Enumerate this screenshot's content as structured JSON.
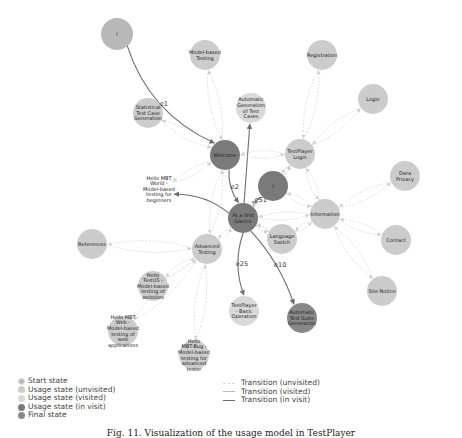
{
  "colors": {
    "start": "#b8b8b8",
    "unvisited": "#cccccc",
    "visited": "#d9d9d9",
    "in_visit": "#7a7a7a",
    "final": "#888888",
    "edge_unvisited": "#d8d8d8",
    "edge_visited": "#bcbcbc",
    "edge_in_visit": "#6e6e6e"
  },
  "nodes": [
    {
      "id": "start",
      "label": [
        "I"
      ],
      "state": "start"
    },
    {
      "id": "model-based-testing",
      "label": [
        "Model-based",
        "Testing"
      ],
      "state": "unvisited"
    },
    {
      "id": "registration",
      "label": [
        "Registration"
      ],
      "state": "unvisited"
    },
    {
      "id": "login",
      "label": [
        "Login"
      ],
      "state": "unvisited"
    },
    {
      "id": "statistical",
      "label": [
        "Statistical",
        "Test Case",
        "Generation"
      ],
      "state": "unvisited"
    },
    {
      "id": "auto-gen",
      "label": [
        "Automatic",
        "Generation",
        "of Test",
        "Cases"
      ],
      "state": "visited"
    },
    {
      "id": "welcome",
      "label": [
        "Welcome"
      ],
      "state": "in_visit"
    },
    {
      "id": "testplayer-login",
      "label": [
        "TestPlayer",
        "Login"
      ],
      "state": "unvisited"
    },
    {
      "id": "data-privacy",
      "label": [
        "Data",
        "Privacy"
      ],
      "state": "unvisited"
    },
    {
      "id": "hello-mbt-world",
      "label": [
        "Hello MBT",
        "World -",
        "Model-based",
        "testing for",
        "beginners"
      ],
      "state": "visited"
    },
    {
      "id": "inner-i",
      "label": [
        "I"
      ],
      "state": "in_visit"
    },
    {
      "id": "first-glance",
      "label": [
        "At a first",
        "Glance"
      ],
      "state": "in_visit"
    },
    {
      "id": "information",
      "label": [
        "Information"
      ],
      "state": "unvisited"
    },
    {
      "id": "language-switch",
      "label": [
        "Language",
        "Switch"
      ],
      "state": "unvisited"
    },
    {
      "id": "references",
      "label": [
        "References"
      ],
      "state": "unvisited"
    },
    {
      "id": "advanced-testing",
      "label": [
        "Advanced",
        "Testing"
      ],
      "state": "unvisited"
    },
    {
      "id": "contact",
      "label": [
        "Contact"
      ],
      "state": "unvisited"
    },
    {
      "id": "hello-testus",
      "label": [
        "Hello",
        "TestUS -",
        "Model-based",
        "testing of",
        "websites"
      ],
      "state": "unvisited"
    },
    {
      "id": "testplayer-basic",
      "label": [
        "TestPlayer",
        "- Basic",
        "Operation"
      ],
      "state": "visited"
    },
    {
      "id": "auto-suite",
      "label": [
        "Automatic",
        "Test Suite",
        "Generation"
      ],
      "state": "final"
    },
    {
      "id": "site-notice",
      "label": [
        "Site Notice"
      ],
      "state": "unvisited"
    },
    {
      "id": "hello-mbt-web",
      "label": [
        "Hello MBT",
        "Web -",
        "Model-based",
        "testing of",
        "web",
        "applications"
      ],
      "state": "unvisited"
    },
    {
      "id": "hello-mbt-bug",
      "label": [
        "Hello",
        "MBT-Bug -",
        "Model-based",
        "testing for",
        "advanced",
        "tester"
      ],
      "state": "unvisited"
    }
  ],
  "edges": [
    {
      "from": "start",
      "to": "welcome",
      "type": "in_visit",
      "label": "e1"
    },
    {
      "from": "welcome",
      "to": "first-glance",
      "type": "in_visit",
      "label": "e2"
    },
    {
      "from": "inner-i",
      "to": "first-glance",
      "type": "in_visit",
      "label": "e51"
    },
    {
      "from": "first-glance",
      "to": "testplayer-basic",
      "type": "in_visit",
      "label": "e25"
    },
    {
      "from": "first-glance",
      "to": "auto-suite",
      "type": "in_visit",
      "label": "e10"
    },
    {
      "from": "first-glance",
      "to": "auto-gen",
      "type": "in_visit",
      "label": ""
    },
    {
      "from": "first-glance",
      "to": "hello-mbt-world",
      "type": "in_visit",
      "label": ""
    },
    {
      "from": "welcome",
      "to": "model-based-testing",
      "type": "unvisited",
      "label": ""
    },
    {
      "from": "welcome",
      "to": "statistical",
      "type": "unvisited",
      "label": ""
    },
    {
      "from": "welcome",
      "to": "testplayer-login",
      "type": "unvisited",
      "label": ""
    },
    {
      "from": "welcome",
      "to": "hello-mbt-world",
      "type": "unvisited",
      "label": ""
    },
    {
      "from": "welcome",
      "to": "advanced-testing",
      "type": "unvisited",
      "label": ""
    },
    {
      "from": "testplayer-login",
      "to": "registration",
      "type": "unvisited",
      "label": ""
    },
    {
      "from": "testplayer-login",
      "to": "login",
      "type": "unvisited",
      "label": ""
    },
    {
      "from": "testplayer-login",
      "to": "information",
      "type": "unvisited",
      "label": ""
    },
    {
      "from": "testplayer-login",
      "to": "first-glance",
      "type": "unvisited",
      "label": ""
    },
    {
      "from": "information",
      "to": "data-privacy",
      "type": "unvisited",
      "label": ""
    },
    {
      "from": "information",
      "to": "contact",
      "type": "unvisited",
      "label": ""
    },
    {
      "from": "information",
      "to": "site-notice",
      "type": "unvisited",
      "label": ""
    },
    {
      "from": "information",
      "to": "first-glance",
      "type": "unvisited",
      "label": ""
    },
    {
      "from": "information",
      "to": "language-switch",
      "type": "unvisited",
      "label": ""
    },
    {
      "from": "inner-i",
      "to": "information",
      "type": "unvisited",
      "label": ""
    },
    {
      "from": "inner-i",
      "to": "testplayer-login",
      "type": "unvisited",
      "label": ""
    },
    {
      "from": "language-switch",
      "to": "first-glance",
      "type": "unvisited",
      "label": ""
    },
    {
      "from": "advanced-testing",
      "to": "references",
      "type": "unvisited",
      "label": ""
    },
    {
      "from": "advanced-testing",
      "to": "hello-testus",
      "type": "unvisited",
      "label": ""
    },
    {
      "from": "advanced-testing",
      "to": "hello-mbt-web",
      "type": "unvisited",
      "label": ""
    },
    {
      "from": "advanced-testing",
      "to": "hello-mbt-bug",
      "type": "unvisited",
      "label": ""
    },
    {
      "from": "advanced-testing",
      "to": "first-glance",
      "type": "unvisited",
      "label": ""
    },
    {
      "from": "first-glance",
      "to": "language-switch",
      "type": "unvisited",
      "label": ""
    }
  ],
  "legend_states": [
    {
      "label": "Start state",
      "state": "start"
    },
    {
      "label": "Usage state (unvisited)",
      "state": "unvisited"
    },
    {
      "label": "Usage state (visited)",
      "state": "visited"
    },
    {
      "label": "Usage state (in visit)",
      "state": "in_visit"
    },
    {
      "label": "Final state",
      "state": "final"
    }
  ],
  "legend_transitions": [
    {
      "label": "Transition (unvisited)",
      "type": "unvisited"
    },
    {
      "label": "Transition (visited)",
      "type": "visited"
    },
    {
      "label": "Transition (in visit)",
      "type": "in_visit"
    }
  ],
  "caption": "Fig. 11. Visualization of the usage model in TestPlayer"
}
